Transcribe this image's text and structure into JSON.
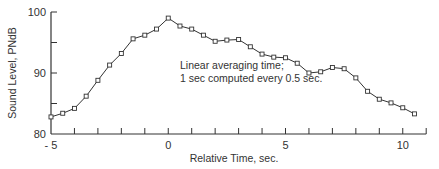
{
  "chart_data": {
    "type": "line",
    "title": "",
    "xlabel": "Relative Time, sec.",
    "ylabel": "Sound Level, PNdB",
    "xlim": [
      -5,
      11
    ],
    "ylim": [
      80,
      100
    ],
    "x_ticks": [
      -5,
      -4,
      -3,
      -2,
      -1,
      0,
      1,
      2,
      3,
      4,
      5,
      6,
      7,
      8,
      9,
      10,
      11
    ],
    "x_tick_labels": [
      {
        "value": -5,
        "label": "- 5"
      },
      {
        "value": 0,
        "label": "0"
      },
      {
        "value": 5,
        "label": "5"
      },
      {
        "value": 10,
        "label": "10"
      }
    ],
    "y_ticks": [
      80,
      85,
      90,
      95,
      100
    ],
    "y_tick_labels": [
      {
        "value": 80,
        "label": "80"
      },
      {
        "value": 90,
        "label": "90"
      },
      {
        "value": 100,
        "label": "100"
      }
    ],
    "grid": false,
    "legend": null,
    "annotations": [
      {
        "text": "Linear averaging time;",
        "x": 0.5,
        "y": 90.6
      },
      {
        "text": "1 sec computed every 0.5 sec.",
        "x": 0.5,
        "y": 88.6
      }
    ],
    "series": [
      {
        "name": "Sound Level",
        "marker": "square",
        "color": "#333333",
        "x": [
          -5,
          -4.5,
          -4,
          -3.5,
          -3,
          -2.5,
          -2,
          -1.5,
          -1,
          -0.5,
          0,
          0.5,
          1,
          1.5,
          2,
          2.5,
          3,
          3.5,
          4,
          4.5,
          5,
          5.5,
          6,
          6.5,
          7,
          7.5,
          8,
          8.5,
          9,
          9.5,
          10,
          10.5
        ],
        "values": [
          82.8,
          83.4,
          84.2,
          86.2,
          88.8,
          91.3,
          93.2,
          95.6,
          96.2,
          97.2,
          99.0,
          97.7,
          97.2,
          96.2,
          95.2,
          95.4,
          95.5,
          94.3,
          93.1,
          92.6,
          92.5,
          91.6,
          90.0,
          90.2,
          90.9,
          90.7,
          89.2,
          87.0,
          85.7,
          85.1,
          84.3,
          83.3
        ]
      }
    ]
  }
}
